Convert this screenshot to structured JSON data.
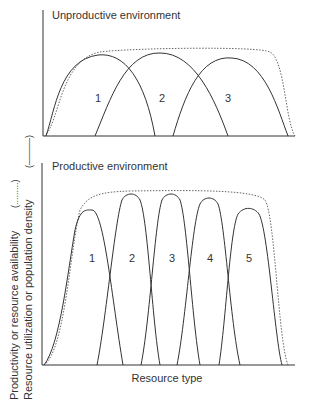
{
  "top_panel": {
    "title": "Unproductive environment",
    "species_labels": [
      "1",
      "2",
      "3"
    ]
  },
  "bottom_panel": {
    "title": "Productive environment",
    "species_labels": [
      "1",
      "2",
      "3",
      "4",
      "5"
    ]
  },
  "y_axis": {
    "label_line1": "Productivity or resource availability",
    "label_line2": "Resource utilization or population density",
    "legend_dotted": "(.........)",
    "legend_solid": "(———)"
  },
  "x_axis": {
    "label": "Resource type"
  }
}
